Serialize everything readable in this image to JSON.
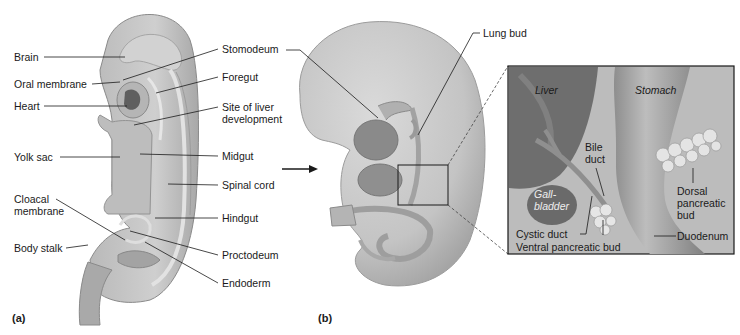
{
  "figure": {
    "panel_a": {
      "label": "(a)",
      "labels": {
        "brain": "Brain",
        "oral_membrane": "Oral membrane",
        "heart": "Heart",
        "yolk_sac": "Yolk sac",
        "cloacal_membrane_1": "Cloacal",
        "cloacal_membrane_2": "membrane",
        "body_stalk": "Body stalk",
        "stomodeum": "Stomodeum",
        "foregut": "Foregut",
        "liver_site_1": "Site of liver",
        "liver_site_2": "development",
        "midgut": "Midgut",
        "spinal_cord": "Spinal cord",
        "hindgut": "Hindgut",
        "proctodeum": "Proctodeum",
        "endoderm": "Endoderm"
      }
    },
    "panel_b": {
      "label": "(b)",
      "labels": {
        "lung_bud": "Lung bud"
      }
    },
    "inset": {
      "labels": {
        "liver": "Liver",
        "stomach": "Stomach",
        "bile_duct_1": "Bile",
        "bile_duct_2": "duct",
        "gallbladder_1": "Gall-",
        "gallbladder_2": "bladder",
        "dorsal_1": "Dorsal",
        "dorsal_2": "pancreatic",
        "dorsal_3": "bud",
        "cystic_duct": "Cystic duct",
        "duodenum": "Duodenum",
        "ventral_bud": "Ventral pancreatic bud"
      }
    },
    "colors": {
      "tissue_light": "#c9c9c9",
      "tissue_mid": "#a9a9a9",
      "tissue_dark": "#7d7d7d",
      "inset_bg": "#b8b8b8",
      "line": "#1a1a1a"
    }
  }
}
